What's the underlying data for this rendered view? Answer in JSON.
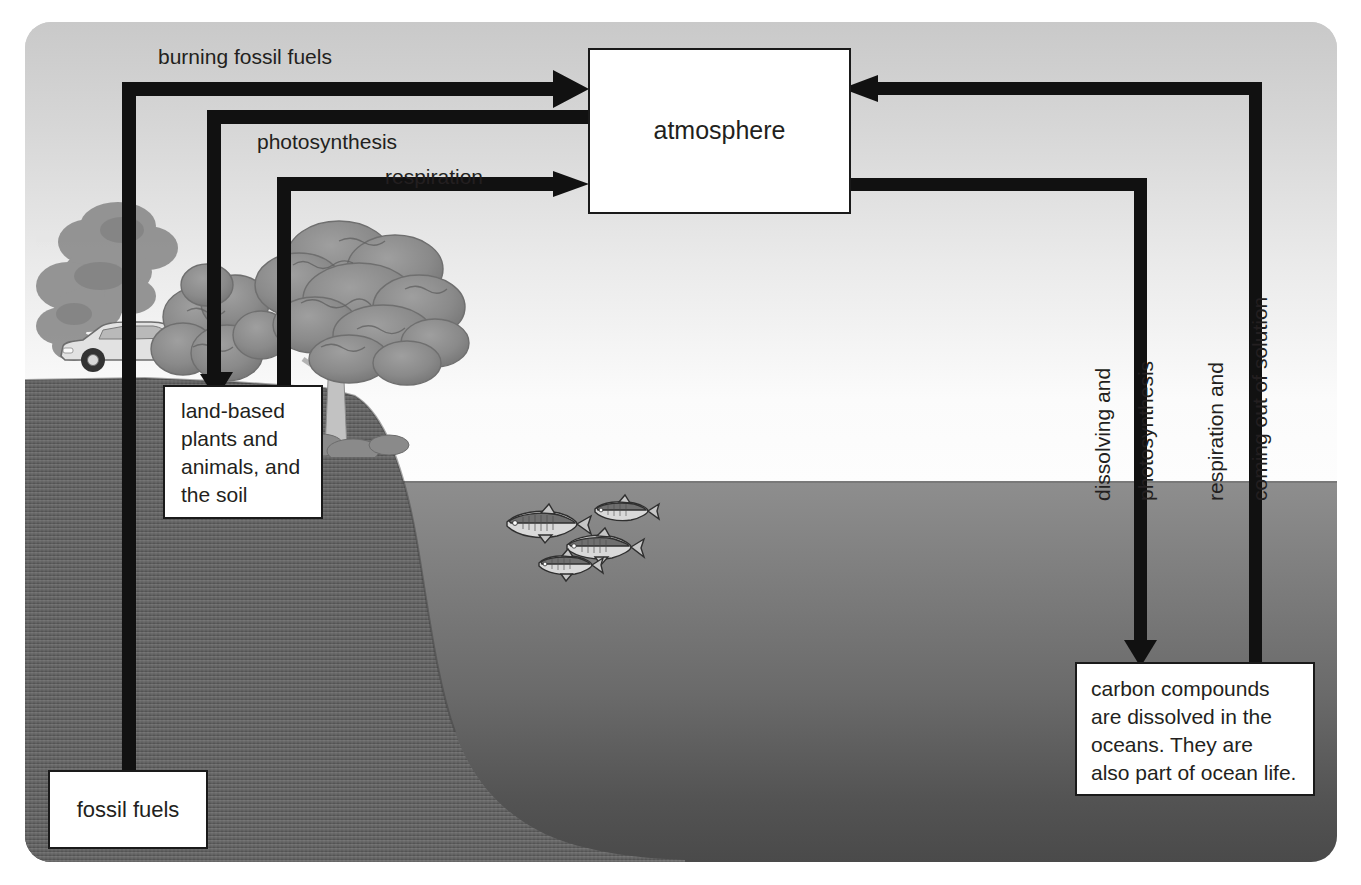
{
  "diagram": {
    "nodes": {
      "atmosphere": "atmosphere",
      "land": "land-based\nplants and\nanimals, and\nthe soil",
      "fossil_fuels": "fossil fuels",
      "ocean": "carbon compounds\nare dissolved in the\noceans. They are\nalso part of ocean life."
    },
    "flow_labels": {
      "burning_fossil_fuels": "burning fossil fuels",
      "photosynthesis": "photosynthesis",
      "respiration": "respiration",
      "dissolving_and": "dissolving and",
      "photosynthesis_ocean": "photosynthesis",
      "respiration_and": "respiration and",
      "coming_out_of_solution": "coming out of solution"
    },
    "scenery": {
      "car": "car",
      "smoke": "exhaust-smoke-plume",
      "trees": "trees",
      "fish": "fish-school",
      "land": "land-cliff",
      "ocean": "ocean-water",
      "sky": "sky"
    },
    "colors": {
      "stroke": "#111111",
      "box_fill": "#ffffff",
      "box_border": "#1a1a1a",
      "text": "#231f20",
      "sky_top": "#c9c9c9",
      "sky_bottom": "#fdfdfd",
      "ocean_top": "#8e8e8e",
      "ocean_bottom": "#4a4a4a",
      "land": "#6e6e6e",
      "foliage": "#8b8b8b"
    }
  }
}
